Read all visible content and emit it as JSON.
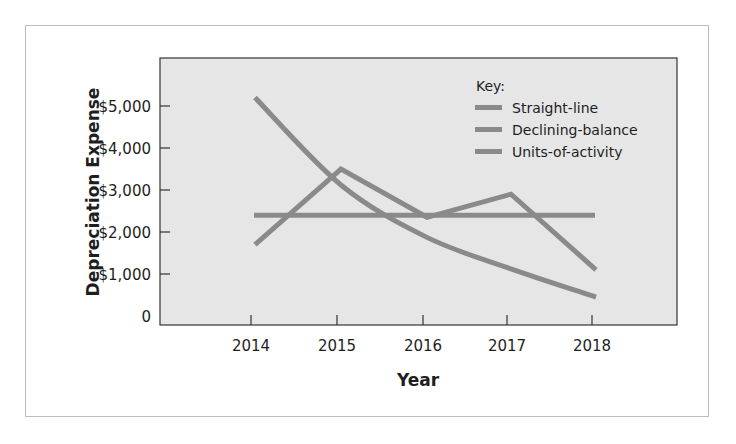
{
  "chart_data": {
    "type": "line",
    "title": "",
    "xlabel": "Year",
    "ylabel": "Depreciation Expense",
    "categories": [
      "2014",
      "2015",
      "2016",
      "2017",
      "2018"
    ],
    "yticks": [
      {
        "value": 0,
        "label": "0"
      },
      {
        "value": 1000,
        "label": "$1,000"
      },
      {
        "value": 2000,
        "label": "$2,000"
      },
      {
        "value": 3000,
        "label": "$3,000"
      },
      {
        "value": 4000,
        "label": "$4,000"
      },
      {
        "value": 5000,
        "label": "$5,000"
      }
    ],
    "ylim": [
      0,
      6000
    ],
    "grid": false,
    "legend_position": "upper right",
    "legend_title": "Key:",
    "series": [
      {
        "name": "Straight-line",
        "values": [
          2400,
          2400,
          2400,
          2400,
          2400
        ],
        "curve": "straight"
      },
      {
        "name": "Declining-balance",
        "values": [
          5200,
          3120,
          1872,
          1123,
          450
        ],
        "curve": "smooth"
      },
      {
        "name": "Units-of-activity",
        "values": [
          1700,
          3500,
          2350,
          2900,
          1100
        ],
        "curve": "straight"
      }
    ],
    "colors": {
      "plot_background": "#e6e6e6",
      "line": "#8a8a8a",
      "axis": "#333333",
      "frame": "#bdbdbd"
    }
  }
}
